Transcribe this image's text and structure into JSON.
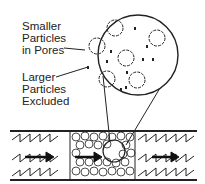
{
  "labels": {
    "smaller": [
      "Smaller",
      "Particles",
      "in Pores"
    ],
    "larger": [
      "Larger",
      "Particles",
      "Excluded"
    ]
  },
  "colors": {
    "line": "#222222",
    "background": "#ffffff"
  },
  "icons": {
    "flow_arrows": [
      "arrow-right-icon",
      "arrow-right-icon",
      "arrow-right-icon"
    ]
  }
}
